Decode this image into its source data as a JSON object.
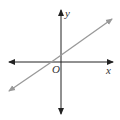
{
  "diagram": {
    "type": "coordinate-plane",
    "labels": {
      "y_axis": "y",
      "x_axis": "x",
      "origin": "O"
    },
    "colors": {
      "axes": "#222222",
      "line": "#999999",
      "background": "#ffffff"
    },
    "line": {
      "description": "line with positive slope crossing the x-axis left of origin and the y-axis above origin",
      "slope_sign": "positive"
    }
  }
}
